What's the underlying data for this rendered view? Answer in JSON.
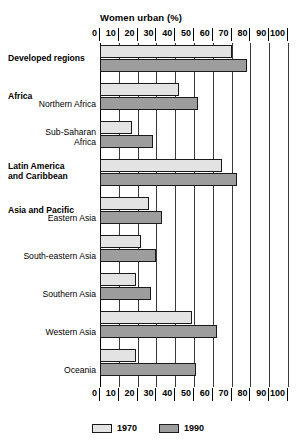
{
  "chart_data": {
    "type": "bar",
    "orientation": "horizontal",
    "title": "Women urban (%)",
    "xlabel": "Women urban (%)",
    "ylabel": "",
    "xlim": [
      0,
      100
    ],
    "xticks": [
      0,
      10,
      20,
      30,
      40,
      50,
      60,
      70,
      80,
      90,
      100
    ],
    "xtick_labels": [
      "0",
      "10",
      "20",
      "30",
      "40",
      "50",
      "60",
      "70",
      "80",
      "90",
      "100"
    ],
    "grid": true,
    "legend_position": "bottom",
    "categories": [
      "Developed regions",
      "Northern Africa",
      "Sub-Saharan Africa",
      "Latin America and Caribbean",
      "Eastern Asia",
      "South-eastern Asia",
      "Southern Asia",
      "Western Asia",
      "Oceania"
    ],
    "series": [
      {
        "name": "1970",
        "color": "#e3e3e3",
        "values": [
          70,
          42,
          17,
          65,
          26,
          22,
          19,
          49,
          19
        ]
      },
      {
        "name": "1990",
        "color": "#9d9d9d",
        "values": [
          78,
          52,
          28,
          73,
          33,
          30,
          27,
          62,
          51
        ]
      }
    ]
  },
  "axis": {
    "title": "Women urban (%)",
    "ticks": [
      "0",
      "10",
      "20",
      "30",
      "40",
      "50",
      "60",
      "70",
      "80",
      "90",
      "100"
    ]
  },
  "rows": [
    {
      "region_heading": "Developed regions",
      "sub_label": "",
      "v1970": 70,
      "v1990": 78
    },
    {
      "region_heading": "Africa",
      "sub_label": "Northern Africa",
      "v1970": 42,
      "v1990": 52
    },
    {
      "region_heading": "",
      "sub_label": "Sub-Saharan\nAfrica",
      "v1970": 17,
      "v1990": 28
    },
    {
      "region_heading": "Latin America\nand Caribbean",
      "sub_label": "",
      "v1970": 65,
      "v1990": 73
    },
    {
      "region_heading": "Asia and Pacific",
      "sub_label": "Eastern Asia",
      "v1970": 26,
      "v1990": 33
    },
    {
      "region_heading": "",
      "sub_label": "South-eastern Asia",
      "v1970": 22,
      "v1990": 30
    },
    {
      "region_heading": "",
      "sub_label": "Southern Asia",
      "v1970": 19,
      "v1990": 27
    },
    {
      "region_heading": "",
      "sub_label": "Western Asia",
      "v1970": 49,
      "v1990": 62
    },
    {
      "region_heading": "",
      "sub_label": "Oceania",
      "v1970": 19,
      "v1990": 51
    }
  ],
  "legend": {
    "items": [
      {
        "label": "1970",
        "color": "#e3e3e3"
      },
      {
        "label": "1990",
        "color": "#9d9d9d"
      }
    ]
  }
}
